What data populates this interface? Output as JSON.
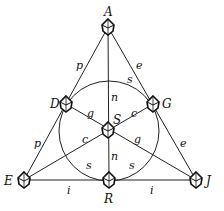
{
  "diagram": {
    "type": "Fano plane",
    "points": [
      {
        "id": "A",
        "label": "A",
        "x": 108,
        "y": 27,
        "lx": 104,
        "ly": 16
      },
      {
        "id": "D",
        "label": "D",
        "x": 66,
        "y": 104,
        "lx": 50,
        "ly": 108
      },
      {
        "id": "G",
        "label": "G",
        "x": 153,
        "y": 104,
        "lx": 162,
        "ly": 108
      },
      {
        "id": "S",
        "label": "S",
        "x": 108,
        "y": 130,
        "lx": 113,
        "ly": 124
      },
      {
        "id": "E",
        "label": "E",
        "x": 24,
        "y": 180,
        "lx": 4,
        "ly": 185
      },
      {
        "id": "R",
        "label": "R",
        "x": 109,
        "y": 180,
        "lx": 104,
        "ly": 203
      },
      {
        "id": "J",
        "label": "J",
        "x": 196,
        "y": 180,
        "lx": 206,
        "ly": 185
      }
    ],
    "lines": [
      {
        "from": "A",
        "to": "E",
        "labels": [
          {
            "text": "p",
            "x": 76,
            "y": 69
          },
          {
            "text": "p",
            "x": 34,
            "y": 147
          }
        ]
      },
      {
        "from": "A",
        "to": "J",
        "labels": [
          {
            "text": "e",
            "x": 136,
            "y": 69
          },
          {
            "text": "e",
            "x": 180,
            "y": 147
          }
        ]
      },
      {
        "from": "E",
        "to": "J",
        "labels": [
          {
            "text": "i",
            "x": 67,
            "y": 194
          },
          {
            "text": "i",
            "x": 150,
            "y": 194
          }
        ]
      },
      {
        "from": "A",
        "to": "R",
        "labels": [
          {
            "text": "n",
            "x": 111,
            "y": 101
          },
          {
            "text": "n",
            "x": 111,
            "y": 160
          }
        ]
      },
      {
        "from": "D",
        "to": "J",
        "labels": [
          {
            "text": "g",
            "x": 87,
            "y": 117
          },
          {
            "text": "g",
            "x": 134,
            "y": 143
          }
        ]
      },
      {
        "from": "G",
        "to": "E",
        "labels": [
          {
            "text": "c",
            "x": 131,
            "y": 117
          },
          {
            "text": "c",
            "x": 82,
            "y": 143
          }
        ]
      }
    ],
    "circle": {
      "cx": 109,
      "cy": 131,
      "r": 50,
      "labels": [
        {
          "text": "s",
          "x": 127,
          "y": 83
        },
        {
          "text": "s",
          "x": 86,
          "y": 169
        },
        {
          "text": "s",
          "x": 129,
          "y": 169
        }
      ]
    }
  }
}
